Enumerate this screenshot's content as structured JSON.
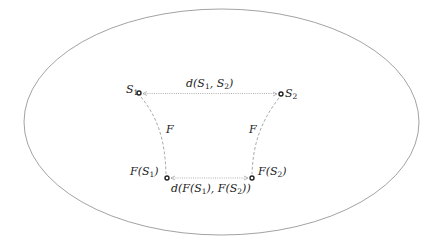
{
  "diagram": {
    "type": "metric-space-mapping",
    "ellipse": {
      "cx": 221.5,
      "cy": 122,
      "rx": 197.5,
      "ry": 113,
      "stroke": "#8a8a8a"
    },
    "points": [
      {
        "id": "S1",
        "x": 139,
        "y": 93
      },
      {
        "id": "S2",
        "x": 281,
        "y": 94
      },
      {
        "id": "FS1",
        "x": 167,
        "y": 178
      },
      {
        "id": "FS2",
        "x": 252,
        "y": 178
      }
    ],
    "labels": {
      "S1": {
        "base": "S",
        "sub": "1"
      },
      "S2": {
        "base": "S",
        "sub": "2"
      },
      "d_top": {
        "pre": "d(S",
        "sub1": "1",
        "mid": ", S",
        "sub2": "2",
        "post": ")"
      },
      "F_left": "F",
      "F_right": "F",
      "FS1": {
        "pre": "F(S",
        "sub": "1",
        "post": ")"
      },
      "FS2": {
        "pre": "F(S",
        "sub": "2",
        "post": ")"
      },
      "d_bottom": {
        "pre": "d(F(S",
        "sub1": "1",
        "mid": "), F(S",
        "sub2": "2",
        "post": "))"
      }
    },
    "colors": {
      "point": "#222222",
      "dotted_line": "#b0b0b0",
      "dashed_curve": "#a0a0a0"
    }
  }
}
